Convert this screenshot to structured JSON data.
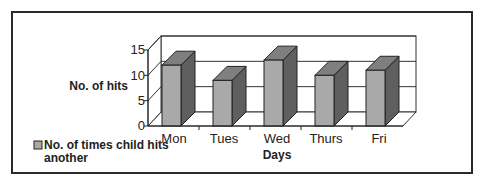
{
  "chart_data": {
    "type": "bar",
    "style": "3d-column",
    "title": "",
    "categories": [
      "Mon",
      "Tues",
      "Wed",
      "Thurs",
      "Fri"
    ],
    "series": [
      {
        "name": "No. of times child hits another",
        "values": [
          12,
          9,
          13,
          10,
          11
        ]
      }
    ],
    "xlabel": "Days",
    "ylabel": "No. of hits",
    "ylim": [
      0,
      15
    ],
    "yticks": [
      "0",
      "5",
      "10",
      "15"
    ],
    "grid": true,
    "legend_position": "bottom-left"
  },
  "colors": {
    "bar_front": "#a9a9a9",
    "bar_top": "#7f7f7f",
    "bar_side": "#5f5f5f",
    "border": "#2a2a2a",
    "grid": "#333333"
  },
  "legend": {
    "line1": "No. of times child hits",
    "line2": "another"
  }
}
